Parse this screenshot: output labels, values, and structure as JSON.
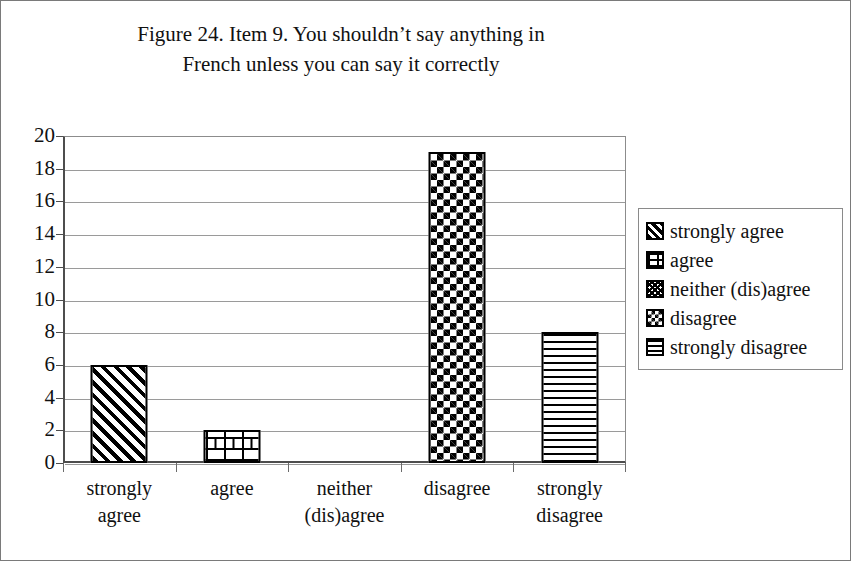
{
  "figure": {
    "title": "Figure 24. Item 9. You shouldn’t say anything in\nFrench unless you can say it correctly"
  },
  "legend": {
    "position": "right",
    "items": [
      {
        "label": "strongly agree",
        "pattern": "diagonal-stripes"
      },
      {
        "label": "agree",
        "pattern": "brick"
      },
      {
        "label": "neither (dis)agree",
        "pattern": "crosshatch"
      },
      {
        "label": "disagree",
        "pattern": "checkerboard"
      },
      {
        "label": "strongly disagree",
        "pattern": "horizontal-lines"
      }
    ]
  },
  "axes": {
    "y_tick_labels": [
      "20",
      "18",
      "16",
      "14",
      "12",
      "10",
      "8",
      "6",
      "4",
      "2",
      "0"
    ],
    "x_tick_labels": [
      "strongly\nagree",
      "agree",
      "neither\n(dis)agree",
      "disagree",
      "strongly\ndisagree"
    ]
  },
  "chart_data": {
    "type": "bar",
    "title": "Figure 24. Item 9. You shouldn’t say anything in French unless you can say it correctly",
    "xlabel": "",
    "ylabel": "",
    "categories": [
      "strongly agree",
      "agree",
      "neither (dis)agree",
      "disagree",
      "strongly disagree"
    ],
    "values": [
      6,
      2,
      0,
      19,
      8
    ],
    "ylim": [
      0,
      20
    ],
    "ytick_step": 2,
    "grid": "horizontal",
    "legend_position": "right",
    "bar_patterns": [
      "diagonal-stripes",
      "brick",
      "crosshatch",
      "checkerboard",
      "horizontal-lines"
    ],
    "colors": {
      "bar_fill": "#ffffff",
      "bar_outline": "#000000",
      "gridline": "#9a9a9a",
      "axis": "#4d4d4d",
      "text": "#111111"
    }
  }
}
